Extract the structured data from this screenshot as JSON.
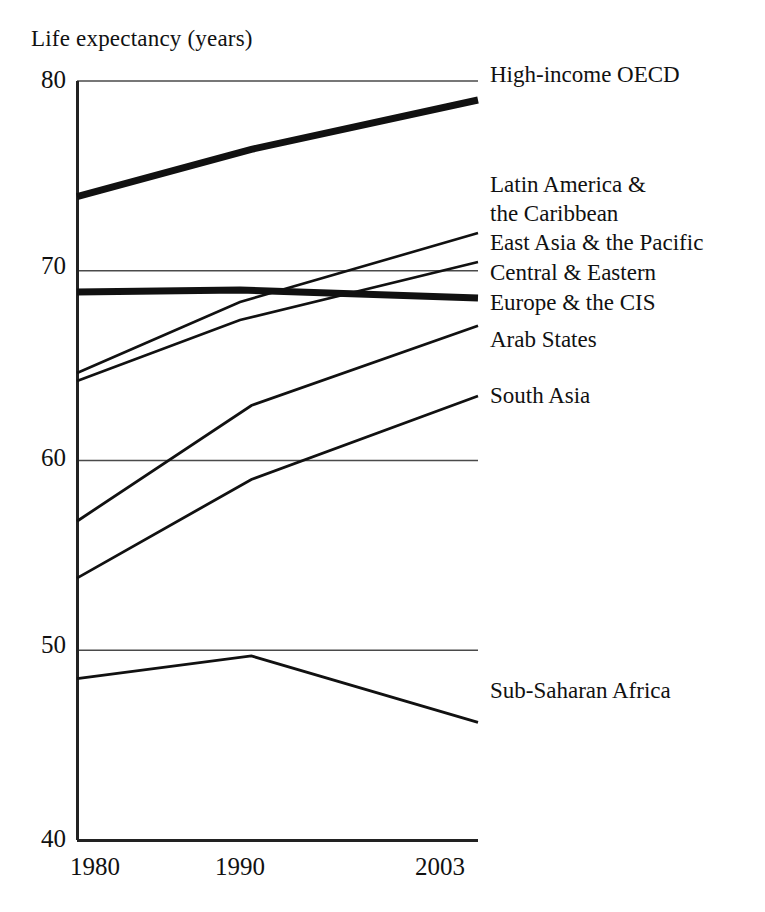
{
  "chart_data": {
    "type": "line",
    "title": "Life expectancy (years)",
    "xlabel": "",
    "ylabel": "Life expectancy (years)",
    "x": [
      1980,
      1990,
      2003
    ],
    "xtick_labels": [
      "1980",
      "1990",
      "2003"
    ],
    "ytick_labels": [
      "80",
      "70",
      "60",
      "50",
      "40"
    ],
    "ytick_values": [
      80,
      70,
      60,
      50,
      40
    ],
    "ylim": [
      40,
      80
    ],
    "xlim": [
      1980,
      2003
    ],
    "grid": true,
    "grid_axis": "y",
    "legend_position": "right-inline-labels",
    "series": [
      {
        "name": "High-income OECD",
        "label": "High-income OECD",
        "values": [
          73.9,
          76.4,
          79.0
        ],
        "emphasis": "thick",
        "label_y_value": 80.0
      },
      {
        "name": "Latin America & the Caribbean",
        "label": "Latin America &\nthe Caribbean",
        "label_line1": "Latin America &",
        "label_line2": "the Caribbean",
        "values": [
          64.2,
          67.9,
          72.0
        ],
        "emphasis": "thin",
        "label_y_value": 73.0
      },
      {
        "name": "East Asia & the Pacific",
        "label": "East Asia & the Pacific",
        "values": [
          63.8,
          67.0,
          70.3
        ],
        "emphasis": "thin",
        "label_y_value": 70.5
      },
      {
        "name": "Central & Eastern Europe & the CIS",
        "label": "Central & Eastern\nEurope & the CIS",
        "label_line1": "Central & Eastern",
        "label_line2": "Europe & the CIS",
        "values": [
          68.9,
          69.0,
          68.6
        ],
        "emphasis": "thick",
        "label_y_value": 68.8
      },
      {
        "name": "Arab States",
        "label": "Arab States",
        "values": [
          56.8,
          62.9,
          67.1
        ],
        "emphasis": "thin",
        "label_y_value": 66.2
      },
      {
        "name": "South Asia",
        "label": "South Asia",
        "values": [
          53.8,
          59.0,
          63.4
        ],
        "emphasis": "thin",
        "label_y_value": 63.8
      },
      {
        "name": "Sub-Saharan Africa",
        "label": "Sub-Saharan Africa",
        "values": [
          48.5,
          49.7,
          46.2
        ],
        "emphasis": "thin",
        "label_y_value": 47.0
      }
    ]
  },
  "axis": {
    "y_ticks": [
      {
        "label": "80"
      },
      {
        "label": "70"
      },
      {
        "label": "60"
      },
      {
        "label": "50"
      },
      {
        "label": "40"
      }
    ],
    "x_ticks": [
      {
        "label": "1980"
      },
      {
        "label": "1990"
      },
      {
        "label": "2003"
      }
    ]
  },
  "labels": {
    "high_income_oecd": "High-income OECD",
    "latin_america_line1": "Latin America &",
    "latin_america_line2": "the Caribbean",
    "east_asia": "East Asia & the Pacific",
    "cee_cis_line1": "Central & Eastern",
    "cee_cis_line2": "Europe & the CIS",
    "arab_states": "Arab States",
    "south_asia": "South Asia",
    "sub_saharan_africa": "Sub-Saharan Africa"
  },
  "colors": {
    "ink": "#111111",
    "grid": "#4a4a4a",
    "background": "#ffffff"
  }
}
